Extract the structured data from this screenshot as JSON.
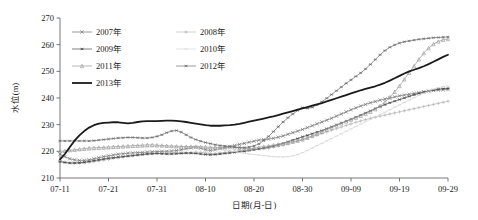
{
  "chart_data": {
    "type": "line",
    "title": "",
    "xlabel": "日期(月-日)",
    "ylabel": "水位(m)",
    "ylim": [
      210,
      270
    ],
    "ytick_step": 10,
    "yticks": [
      "210",
      "220",
      "230",
      "240",
      "250",
      "260",
      "270"
    ],
    "xticks": [
      "07-11",
      "07-21",
      "07-31",
      "08-10",
      "08-20",
      "08-30",
      "09-09",
      "09-19",
      "09-29"
    ],
    "x_index_of_ticks": [
      0,
      10,
      20,
      30,
      40,
      50,
      60,
      70,
      80
    ],
    "x_count": 81,
    "grid": false,
    "legend_position": "top-left-inside",
    "legend": [
      "2007年",
      "2008年",
      "2009年",
      "2010年",
      "2011年",
      "2012年",
      "2013年"
    ],
    "series": [
      {
        "name": "2007年",
        "color": "#6f6f6f",
        "marker": "x-cross",
        "linewidth": 0.7,
        "values": [
          219.0,
          218.0,
          217.2,
          216.8,
          216.6,
          216.6,
          216.8,
          217.2,
          217.6,
          218.0,
          218.3,
          218.6,
          218.9,
          219.1,
          219.3,
          219.4,
          219.5,
          219.6,
          219.7,
          219.8,
          219.9,
          220.0,
          220.0,
          220.1,
          220.3,
          220.6,
          221.0,
          221.3,
          221.5,
          221.2,
          220.6,
          220.3,
          220.6,
          221.0,
          221.4,
          221.8,
          222.2,
          222.6,
          223.0,
          223.4,
          223.8,
          224.2,
          224.4,
          224.6,
          224.9,
          225.3,
          225.8,
          226.4,
          227.0,
          227.6,
          228.2,
          228.9,
          229.6,
          230.3,
          231.0,
          231.7,
          232.4,
          233.2,
          234.0,
          234.8,
          235.6,
          236.3,
          237.0,
          237.6,
          238.2,
          238.7,
          239.2,
          239.6,
          240.0,
          240.4,
          240.8,
          241.1,
          241.4,
          241.7,
          242.0,
          242.3,
          242.6,
          242.8,
          243.0,
          243.1,
          243.2
        ]
      },
      {
        "name": "2008年",
        "color": "#b4b4b4",
        "marker": "plus",
        "linewidth": 0.6,
        "values": [
          216.6,
          216.0,
          215.7,
          215.6,
          215.6,
          215.7,
          215.9,
          216.1,
          216.4,
          216.7,
          217.0,
          217.3,
          217.6,
          217.9,
          218.2,
          218.4,
          218.6,
          218.8,
          219.0,
          219.1,
          219.2,
          219.3,
          219.3,
          219.4,
          219.5,
          219.5,
          219.6,
          219.6,
          219.7,
          219.6,
          219.4,
          219.2,
          219.2,
          219.4,
          219.6,
          219.8,
          220.0,
          220.2,
          220.4,
          220.6,
          220.8,
          220.9,
          221.0,
          221.2,
          221.5,
          221.9,
          222.3,
          222.8,
          223.3,
          223.8,
          224.3,
          224.9,
          225.5,
          226.1,
          226.7,
          227.3,
          227.9,
          228.5,
          229.1,
          229.7,
          230.3,
          230.9,
          231.4,
          231.9,
          232.4,
          232.8,
          233.2,
          233.6,
          234.0,
          234.4,
          234.8,
          235.2,
          235.6,
          236.0,
          236.4,
          236.8,
          237.2,
          237.6,
          238.0,
          238.4,
          238.8
        ]
      },
      {
        "name": "2009年",
        "color": "#4a4a4a",
        "marker": "asterisk",
        "linewidth": 0.7,
        "values": [
          216.1,
          215.8,
          215.6,
          215.6,
          215.7,
          215.9,
          216.2,
          216.5,
          216.8,
          217.1,
          217.4,
          217.6,
          217.8,
          218.0,
          218.2,
          218.4,
          218.6,
          218.8,
          219.0,
          219.1,
          219.2,
          219.1,
          219.0,
          219.0,
          219.1,
          219.2,
          219.3,
          219.3,
          219.2,
          219.0,
          218.8,
          218.7,
          218.8,
          219.0,
          219.2,
          219.4,
          219.6,
          219.8,
          220.0,
          220.3,
          220.6,
          220.9,
          221.2,
          221.6,
          222.0,
          222.5,
          223.0,
          223.6,
          224.2,
          224.8,
          225.4,
          226.0,
          226.6,
          227.2,
          227.8,
          228.5,
          229.2,
          229.9,
          230.6,
          231.3,
          232.0,
          232.8,
          233.6,
          234.4,
          235.2,
          236.0,
          236.8,
          237.5,
          238.2,
          238.8,
          239.4,
          240.0,
          240.6,
          241.2,
          241.7,
          242.2,
          242.6,
          243.0,
          243.3,
          243.5,
          243.6
        ]
      },
      {
        "name": "2010年",
        "color": "#d2d2d2",
        "marker": "dash",
        "linewidth": 0.6,
        "values": [
          219.6,
          219.8,
          220.0,
          220.2,
          220.3,
          220.4,
          220.5,
          220.6,
          220.7,
          220.8,
          220.9,
          221.0,
          221.1,
          221.2,
          221.3,
          221.4,
          221.5,
          221.6,
          221.6,
          221.7,
          221.7,
          221.7,
          221.7,
          221.6,
          221.6,
          221.6,
          221.5,
          221.5,
          221.5,
          221.4,
          221.3,
          221.2,
          221.0,
          220.8,
          220.5,
          220.2,
          219.9,
          219.6,
          219.3,
          219.0,
          218.8,
          218.6,
          218.4,
          218.2,
          218.0,
          217.9,
          217.9,
          218.0,
          218.3,
          218.8,
          219.5,
          220.3,
          221.2,
          222.1,
          223.0,
          223.9,
          224.8,
          225.7,
          226.6,
          227.5,
          228.4,
          229.3,
          230.2,
          231.1,
          232.0,
          232.9,
          233.8,
          234.7,
          235.6,
          236.5,
          237.4,
          238.3,
          239.2,
          240.1,
          241.0,
          241.8,
          242.6,
          243.3,
          243.9,
          244.3,
          244.5
        ]
      },
      {
        "name": "2011年",
        "color": "#9a9a9a",
        "marker": "triangle",
        "linewidth": 0.7,
        "values": [
          220.0,
          220.2,
          220.4,
          220.6,
          220.8,
          221.0,
          221.2,
          221.3,
          221.4,
          221.5,
          221.6,
          221.7,
          221.8,
          221.9,
          222.0,
          222.1,
          222.2,
          222.3,
          222.4,
          222.4,
          222.3,
          222.2,
          222.1,
          222.0,
          221.9,
          221.8,
          221.8,
          221.8,
          221.8,
          221.7,
          221.6,
          221.5,
          221.5,
          221.5,
          221.6,
          221.6,
          221.5,
          221.3,
          221.1,
          221.0,
          221.2,
          221.5,
          221.8,
          222.0,
          222.3,
          222.6,
          222.9,
          223.2,
          223.6,
          224.0,
          224.5,
          225.1,
          225.8,
          226.5,
          227.3,
          228.1,
          228.9,
          229.7,
          230.5,
          231.2,
          231.9,
          232.6,
          233.3,
          234.0,
          234.8,
          235.8,
          237.0,
          238.5,
          240.3,
          242.3,
          244.5,
          247.0,
          249.5,
          252.0,
          254.5,
          256.8,
          258.7,
          260.2,
          261.2,
          261.8,
          262.1
        ]
      },
      {
        "name": "2012年",
        "color": "#707070",
        "marker": "asterisk",
        "linewidth": 0.7,
        "values": [
          223.9,
          223.9,
          223.9,
          223.9,
          223.9,
          223.9,
          223.9,
          224.0,
          224.2,
          224.4,
          224.6,
          224.8,
          225.0,
          225.1,
          225.2,
          225.2,
          225.1,
          225.0,
          225.0,
          225.2,
          225.6,
          226.2,
          227.0,
          227.6,
          227.8,
          227.2,
          226.2,
          225.2,
          224.4,
          223.8,
          223.3,
          222.9,
          222.5,
          222.2,
          222.0,
          221.8,
          221.6,
          221.4,
          221.4,
          221.6,
          222.0,
          222.8,
          224.0,
          225.6,
          227.4,
          229.2,
          231.0,
          232.6,
          234.0,
          235.3,
          236.4,
          236.1,
          236.5,
          237.4,
          238.6,
          239.9,
          241.3,
          242.7,
          244.1,
          245.5,
          246.8,
          248.1,
          249.4,
          250.9,
          252.6,
          254.4,
          256.2,
          257.8,
          259.0,
          259.9,
          260.6,
          261.1,
          261.4,
          261.7,
          262.0,
          262.2,
          262.4,
          262.6,
          262.7,
          262.8,
          262.9
        ]
      },
      {
        "name": "2013年",
        "color": "#1a1a1a",
        "marker": "none",
        "linewidth": 1.8,
        "values": [
          217.0,
          219.0,
          221.5,
          224.0,
          226.0,
          227.6,
          228.9,
          229.8,
          230.4,
          230.7,
          230.8,
          230.9,
          230.9,
          230.7,
          230.5,
          230.7,
          231.0,
          231.2,
          231.3,
          231.3,
          231.3,
          231.4,
          231.5,
          231.5,
          231.4,
          231.2,
          231.0,
          230.7,
          230.4,
          230.1,
          229.8,
          229.6,
          229.6,
          229.6,
          229.7,
          229.8,
          230.0,
          230.3,
          230.7,
          231.1,
          231.5,
          231.9,
          232.3,
          232.7,
          233.1,
          233.6,
          234.1,
          234.6,
          235.1,
          235.6,
          236.1,
          236.6,
          237.1,
          237.6,
          238.1,
          238.7,
          239.3,
          239.9,
          240.5,
          241.1,
          241.7,
          242.3,
          242.9,
          243.4,
          243.9,
          244.4,
          245.0,
          245.7,
          246.5,
          247.4,
          248.3,
          249.2,
          250.0,
          250.6,
          251.2,
          251.9,
          252.7,
          253.6,
          254.5,
          255.4,
          256.2
        ]
      }
    ]
  }
}
